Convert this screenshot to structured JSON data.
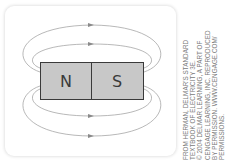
{
  "diagram": {
    "magnet": {
      "north_label": "N",
      "south_label": "S",
      "fill_color": "#c8c8c8",
      "border_color": "#3a3a3a"
    },
    "field_lines": {
      "count": 4,
      "color": "#9a9a9a",
      "arrow_direction": "right (N to S outside the magnet)"
    }
  },
  "credit": {
    "lines": [
      "FROM HERMAN, DELMAR'S STANDARD",
      "TEXTBOOK OF ELECTRICITY 3E.",
      "© 2004 DELMAR LEARNING, A PART OF",
      "CENGAGE LEARNING, INC. REPRODUCED",
      "BY PERMISSION. WWW.CENGAGE.COM/",
      "PERMISSIONS."
    ]
  }
}
